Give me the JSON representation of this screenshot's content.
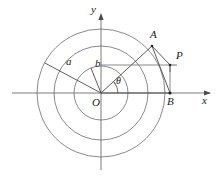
{
  "figure": {
    "background_color": "#ffffff",
    "stroke_color": "#555555",
    "text_color": "#1a1a1a",
    "width": 220,
    "height": 180
  },
  "axes": {
    "origin_label": "O",
    "x_axis_label": "x",
    "y_axis_label": "y",
    "origin": {
      "x": 101,
      "y": 93
    },
    "x_axis": {
      "x1": 12,
      "y1": 93,
      "x2": 212,
      "y2": 93,
      "arrow": "right"
    },
    "y_axis": {
      "x1": 101,
      "y1": 168,
      "x2": 101,
      "y2": 14,
      "arrow": "up"
    }
  },
  "circles": [
    {
      "name": "inner-circle",
      "cx": 101,
      "cy": 93,
      "r": 27,
      "label": "b"
    },
    {
      "name": "middle-circle",
      "cx": 101,
      "cy": 93,
      "r": 47,
      "label": ""
    },
    {
      "name": "outer-circle",
      "cx": 101,
      "cy": 93,
      "r": 64,
      "label": "a"
    }
  ],
  "rays": [
    {
      "name": "ray-a",
      "angle_deg": 152,
      "x1": 101,
      "y1": 93,
      "x2": 45,
      "y2": 63,
      "label": "a",
      "label_x": 69,
      "label_y": 59
    },
    {
      "name": "ray-b",
      "angle_deg": 112,
      "x1": 101,
      "y1": 93,
      "x2": 91,
      "y2": 68,
      "label": "b",
      "label_x": 96,
      "label_y": 63
    },
    {
      "name": "ray-theta",
      "angle_deg": 40,
      "x1": 101,
      "y1": 93,
      "x2": 153,
      "y2": 46,
      "label": "",
      "label_x": 0,
      "label_y": 0
    }
  ],
  "points": [
    {
      "name": "point-O",
      "label": "O",
      "x": 101,
      "y": 93,
      "label_x": 94,
      "label_y": 96,
      "dot": false
    },
    {
      "name": "point-A",
      "label": "A",
      "x": 152,
      "y": 46,
      "label_x": 152,
      "label_y": 31,
      "dot": true
    },
    {
      "name": "point-P",
      "label": "P",
      "x": 170,
      "y": 65,
      "label_x": 175,
      "label_y": 53,
      "dot": true
    },
    {
      "name": "point-B",
      "label": "B",
      "x": 170,
      "y": 93,
      "label_x": 167,
      "label_y": 96,
      "dot": true
    }
  ],
  "segments": [
    {
      "name": "segment-A-to-B",
      "x1": 152,
      "y1": 46,
      "x2": 170,
      "y2": 93
    },
    {
      "name": "segment-O-to-B",
      "x1": 101,
      "y1": 93,
      "x2": 170,
      "y2": 93
    },
    {
      "name": "segment-A-to-P",
      "x1": 152,
      "y1": 46,
      "x2": 170,
      "y2": 65
    },
    {
      "name": "segment-horizontal-through-P",
      "x1": 101,
      "y1": 65,
      "x2": 170,
      "y2": 65
    }
  ],
  "angle_marks": [
    {
      "name": "angle-theta",
      "label": "θ",
      "label_x": 118,
      "label_y": 78,
      "cx": 101,
      "cy": 93,
      "r": 17,
      "start_deg": 0,
      "end_deg": 40
    }
  ],
  "right_angle": {
    "name": "right-angle-at-P",
    "vertex_x": 170,
    "vertex_y": 65,
    "size": 8
  }
}
